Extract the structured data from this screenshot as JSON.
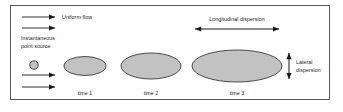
{
  "figure": {
    "frame_color": "#58585a",
    "background_color": "#ffffff"
  },
  "labels": {
    "uniform_flow": "Uniform flow",
    "instantaneous_point_source_line1": "Instantaneous",
    "instantaneous_point_source_line2": "point source",
    "longitudinal_dispersion": "Longitudinal dispersion",
    "lateral_dispersion_line1": "Lateral",
    "lateral_dispersion_line2": "dispersion",
    "time_1": "time 1",
    "time_2": "time 2",
    "time_3": "time 3"
  },
  "diagram_data": {
    "type": "schematic",
    "plume_fill_color": "#c2c2c2",
    "plume_stroke_color": "#3a3a3a",
    "arrow_color": "#1b1b1b",
    "source": {
      "name": "instantaneous-point-source",
      "shape": "circle",
      "cx": 34,
      "cy": 65,
      "r": 4.2
    },
    "plumes": [
      {
        "name": "plume-time-1",
        "time_label": "time 1",
        "cx": 85,
        "cy": 66,
        "rx": 21,
        "ry": 9.5
      },
      {
        "name": "plume-time-2",
        "time_label": "time 2",
        "cx": 151,
        "cy": 66,
        "rx": 30,
        "ry": 13
      },
      {
        "name": "plume-time-3",
        "time_label": "time 3",
        "cx": 237,
        "cy": 66,
        "rx": 45,
        "ry": 16
      }
    ],
    "flow_arrows": [
      {
        "name": "flow-arrow-top-1",
        "x1": 22,
        "x2": 57,
        "y": 17
      },
      {
        "name": "flow-arrow-top-2",
        "x1": 22,
        "x2": 57,
        "y": 28
      },
      {
        "name": "flow-arrow-bottom-1",
        "x1": 22,
        "x2": 57,
        "y": 75
      },
      {
        "name": "flow-arrow-bottom-2",
        "x1": 22,
        "x2": 57,
        "y": 87
      }
    ],
    "dispersion_arrows": [
      {
        "name": "longitudinal-dispersion-arrow",
        "orientation": "horizontal",
        "x1": 192,
        "x2": 282,
        "y": 29
      },
      {
        "name": "lateral-dispersion-arrow",
        "orientation": "vertical",
        "x": 289,
        "y1": 50,
        "y2": 82
      }
    ],
    "time_label_positions": [
      {
        "x": 85,
        "y": 95
      },
      {
        "x": 151,
        "y": 95
      },
      {
        "x": 237,
        "y": 95
      }
    ]
  }
}
